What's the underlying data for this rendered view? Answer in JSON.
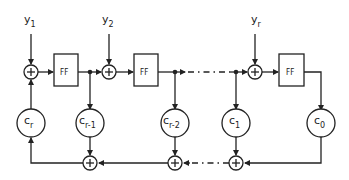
{
  "diagram": {
    "type": "block-diagram",
    "inputs": [
      {
        "base": "y",
        "sub": "1"
      },
      {
        "base": "y",
        "sub": "2"
      },
      {
        "base": "y",
        "sub": "r"
      }
    ],
    "flipflops": [
      {
        "label": "FF"
      },
      {
        "label": "FF"
      },
      {
        "label": "FF"
      }
    ],
    "coefficients": [
      {
        "base": "c",
        "sub": "r"
      },
      {
        "base": "c",
        "sub": "r-1"
      },
      {
        "base": "c",
        "sub": "r-2"
      },
      {
        "base": "c",
        "sub": "1"
      },
      {
        "base": "c",
        "sub": "0"
      }
    ],
    "adder_symbol": "+",
    "colors": {
      "stroke": "#222222",
      "background": "#ffffff"
    }
  }
}
